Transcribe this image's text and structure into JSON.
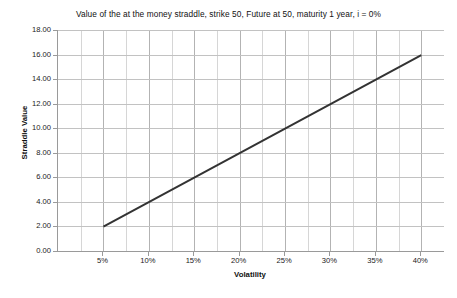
{
  "chart_data": {
    "type": "line",
    "title": "Value of the at the money straddle, strike 50, Future at 50, maturity 1 year, i = 0%",
    "xlabel": "Volatility",
    "ylabel": "Straddle Value",
    "xlim": [
      0,
      42.5
    ],
    "ylim": [
      0,
      18
    ],
    "x_tick_labels": [
      "5%",
      "10%",
      "15%",
      "20%",
      "25%",
      "30%",
      "35%",
      "40%"
    ],
    "x_tick_values": [
      5,
      10,
      15,
      20,
      25,
      30,
      35,
      40
    ],
    "x_minor_step": 2.5,
    "y_tick_labels": [
      "0.00",
      "2.00",
      "4.00",
      "6.00",
      "8.00",
      "10.00",
      "12.00",
      "14.00",
      "16.00",
      "18.00"
    ],
    "y_tick_values": [
      0,
      2,
      4,
      6,
      8,
      10,
      12,
      14,
      16,
      18
    ],
    "grid": true,
    "legend": false,
    "series": [
      {
        "name": "Straddle Value",
        "color": "#333333",
        "line_width": 2,
        "x": [
          5,
          10,
          15,
          20,
          25,
          30,
          35,
          40
        ],
        "values": [
          1.99,
          3.99,
          5.98,
          7.98,
          9.97,
          11.97,
          13.96,
          15.96
        ]
      }
    ]
  }
}
